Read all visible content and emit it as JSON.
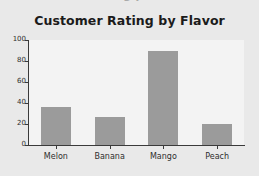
{
  "clipped_top_text": "ng p",
  "chart_data": {
    "type": "bar",
    "title": "Customer Rating by Flavor",
    "xlabel": "",
    "ylabel": "",
    "categories": [
      "Melon",
      "Banana",
      "Mango",
      "Peach"
    ],
    "values": [
      36,
      27,
      90,
      20
    ],
    "ylim": [
      0,
      100
    ],
    "yticks": [
      0,
      20,
      40,
      60,
      80,
      100
    ],
    "grid": false,
    "legend": false,
    "bar_color": "#9b9b9b",
    "figure_background": "#e9e9e9",
    "axes_background": "#f3f3f3",
    "axis_color": "#3a3a3a",
    "title_color": "#1b1b1b",
    "tick_label_color": "#2e2e2e"
  }
}
